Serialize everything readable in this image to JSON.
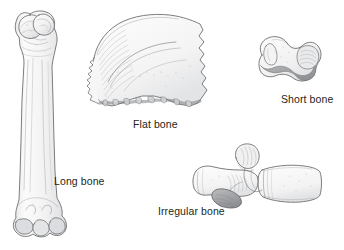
{
  "figure": {
    "background_color": "#ffffff",
    "line_color": "#58595b",
    "fill_light": "#f7f7f7",
    "fill_mid": "#d9d9d9",
    "fill_dark": "#a7a9ac",
    "label_color": "#231f20"
  },
  "labels": {
    "long_bone": "Long bone",
    "flat_bone": "Flat bone",
    "short_bone": "Short bone",
    "irregular_bone": "Irregular bone"
  },
  "illustrations": {
    "long_bone": {
      "name": "long-bone-femur",
      "description": "Femur shown in full length, proximal head and greater trochanter at top, condyles at bottom"
    },
    "flat_bone": {
      "name": "flat-bone-cranial",
      "description": "Curved cranial flat bone with serrated left margin, wavy sutured right margin and nodular diploe lower edge"
    },
    "short_bone": {
      "name": "short-bone-carpal",
      "description": "Cube-like carpal bone with shaded articular surface"
    },
    "irregular_bone": {
      "name": "irregular-bone-vertebra",
      "description": "Vertebra in lateral view with body, transverse process and shaded spinous process"
    }
  }
}
